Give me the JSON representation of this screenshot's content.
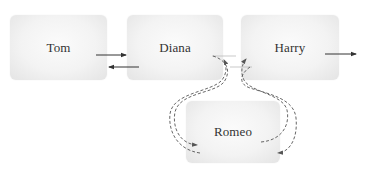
{
  "diagram": {
    "type": "linked-list-insertion",
    "nodes": [
      {
        "id": "tom",
        "label": "Tom"
      },
      {
        "id": "diana",
        "label": "Diana"
      },
      {
        "id": "harry",
        "label": "Harry"
      },
      {
        "id": "romeo",
        "label": "Romeo"
      }
    ],
    "edges": [
      {
        "from": "tom",
        "to": "diana",
        "style": "solid"
      },
      {
        "from": "diana",
        "to": "tom",
        "style": "solid"
      },
      {
        "from": "harry",
        "to": "next",
        "style": "solid"
      },
      {
        "from": "diana",
        "to": "romeo",
        "style": "dashed"
      },
      {
        "from": "romeo",
        "to": "harry",
        "style": "dashed"
      },
      {
        "from": "harry",
        "to": "romeo",
        "style": "dashed"
      },
      {
        "from": "romeo",
        "to": "diana",
        "style": "dashed"
      }
    ],
    "colors": {
      "node_fill": "#f3f3f3",
      "node_edge": "#e4e4e4",
      "arrow": "#333333",
      "dashed_arrow": "#555555",
      "text": "#333333"
    }
  }
}
